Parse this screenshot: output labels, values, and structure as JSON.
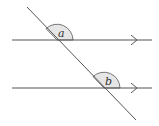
{
  "diagram": {
    "type": "parallel-lines-transversal",
    "lines": {
      "upper": {
        "y": 40,
        "x1": 12,
        "x2": 152,
        "arrow_x": 135
      },
      "lower": {
        "y": 88,
        "x1": 12,
        "x2": 152,
        "arrow_x": 135
      },
      "transversal": {
        "x1": 27,
        "y1": 7,
        "x2": 136,
        "y2": 120
      }
    },
    "angles": [
      {
        "label": "a",
        "vertex": [
          57,
          40
        ]
      },
      {
        "label": "b",
        "vertex": [
          104,
          88
        ]
      }
    ],
    "colors": {
      "line": "#555555",
      "arc_fill": "#e6e6e6",
      "arc_stroke": "#555555"
    }
  }
}
